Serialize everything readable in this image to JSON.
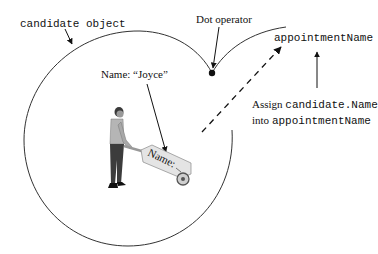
{
  "diagram": {
    "object_label": "candidate object",
    "property_label": "Name: “Joyce”",
    "operator_label": "Dot operator",
    "target_variable": "appointmentName",
    "assign_line1_prefix": "Assign ",
    "assign_line1_code": "candidate.Name",
    "assign_line2_prefix": "into ",
    "assign_line2_code": "appointmentName",
    "cart_label": "Name:",
    "colors": {
      "stroke": "#333333",
      "text": "#111111"
    }
  }
}
